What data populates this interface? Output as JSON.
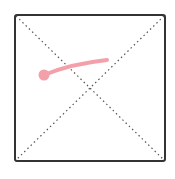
{
  "canvas": {
    "frame": {
      "x": 15,
      "y": 15,
      "x2": 165,
      "y2": 161,
      "border_color": "#333333"
    },
    "guides": {
      "style": "dotted",
      "color": "#555555",
      "lines": [
        {
          "name": "diagonal-top-left-to-bottom-right",
          "x1": 16,
          "y1": 16,
          "x2": 164,
          "y2": 160
        },
        {
          "name": "diagonal-top-right-to-bottom-left",
          "x1": 164,
          "y1": 16,
          "x2": 16,
          "y2": 160
        }
      ]
    },
    "strokes": [
      {
        "name": "pink-freehand-stroke",
        "color": "#f4a0ab",
        "width": 4,
        "path": "M 44 75 Q 70 64 107 60",
        "start_dot": {
          "cx": 44,
          "cy": 75,
          "r": 5.5
        }
      }
    ]
  }
}
